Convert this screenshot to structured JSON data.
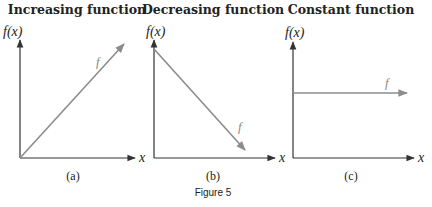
{
  "figure": {
    "caption": "Figure 5",
    "colors": {
      "axis": "#333333",
      "function_line": "#8c8c8c",
      "text": "#222222"
    }
  },
  "panels": [
    {
      "id": "a",
      "title": "Increasing function",
      "y_axis_label": "f(x)",
      "x_axis_label": "x",
      "function_label": "f",
      "sub_label": "(a)",
      "trend": "increasing"
    },
    {
      "id": "b",
      "title": "Decreasing function",
      "y_axis_label": "f(x)",
      "x_axis_label": "x",
      "function_label": "f",
      "sub_label": "(b)",
      "trend": "decreasing"
    },
    {
      "id": "c",
      "title": "Constant function",
      "y_axis_label": "f(x)",
      "x_axis_label": "x",
      "function_label": "f",
      "sub_label": "(c)",
      "trend": "constant"
    }
  ]
}
